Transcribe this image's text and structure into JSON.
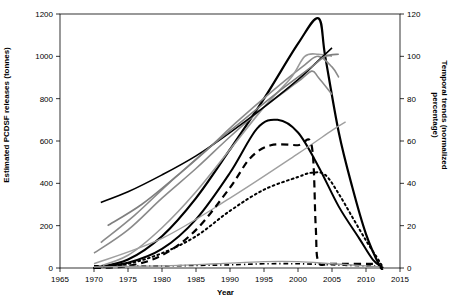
{
  "chart_data": {
    "type": "line",
    "title": "",
    "xlabel": "Year",
    "ylabel_left": "Estimated PCDSF releases (tonnes)",
    "ylabel_right": "Temporal trends (normalized percentage)",
    "xlim": [
      1965,
      2015
    ],
    "ylim_left": [
      0,
      1200
    ],
    "ylim_right": [
      0,
      120
    ],
    "xticks": [
      "1965",
      "1970",
      "1975",
      "1980",
      "1985",
      "1990",
      "1995",
      "2000",
      "2005",
      "2010",
      "2015"
    ],
    "yticks_left": [
      "0",
      "200",
      "400",
      "600",
      "800",
      "1000",
      "1200"
    ],
    "yticks_right": [
      "0",
      "20",
      "40",
      "60",
      "80",
      "100",
      "120"
    ],
    "grid": false,
    "legend": "none",
    "series": [
      {
        "name": "emission-curve-peak-2003-thick-black",
        "axis": "left",
        "color": "#000000",
        "width": 2.2,
        "dash": "none",
        "points": [
          [
            1970,
            0
          ],
          [
            1975,
            40
          ],
          [
            1980,
            150
          ],
          [
            1985,
            330
          ],
          [
            1990,
            560
          ],
          [
            1995,
            800
          ],
          [
            2000,
            1060
          ],
          [
            2003,
            1180
          ],
          [
            2004,
            1000
          ],
          [
            2006,
            640
          ],
          [
            2008,
            380
          ],
          [
            2010,
            160
          ],
          [
            2012,
            10
          ],
          [
            2012.5,
            0
          ]
        ]
      },
      {
        "name": "emission-curve-bell-peak-1997",
        "axis": "left",
        "color": "#000000",
        "width": 2.0,
        "dash": "none",
        "points": [
          [
            1970,
            5
          ],
          [
            1975,
            25
          ],
          [
            1980,
            90
          ],
          [
            1985,
            230
          ],
          [
            1990,
            450
          ],
          [
            1994,
            660
          ],
          [
            1997,
            700
          ],
          [
            2000,
            640
          ],
          [
            2003,
            480
          ],
          [
            2006,
            290
          ],
          [
            2009,
            140
          ],
          [
            2011,
            40
          ],
          [
            2012.5,
            0
          ]
        ]
      },
      {
        "name": "emission-curve-grey-rising-1",
        "axis": "left",
        "color": "#8a8a8a",
        "width": 1.6,
        "dash": "none",
        "points": [
          [
            1970,
            70
          ],
          [
            1975,
            180
          ],
          [
            1980,
            330
          ],
          [
            1985,
            470
          ],
          [
            1990,
            620
          ],
          [
            1995,
            760
          ],
          [
            2000,
            880
          ],
          [
            2002,
            930
          ],
          [
            2003,
            900
          ],
          [
            2005,
            820
          ]
        ]
      },
      {
        "name": "emission-curve-grey-rising-2",
        "axis": "left",
        "color": "#8a8a8a",
        "width": 1.6,
        "dash": "none",
        "points": [
          [
            1971,
            120
          ],
          [
            1976,
            250
          ],
          [
            1981,
            400
          ],
          [
            1986,
            540
          ],
          [
            1991,
            690
          ],
          [
            1996,
            830
          ],
          [
            2001,
            960
          ],
          [
            2003,
            1000
          ],
          [
            2005,
            950
          ],
          [
            2006,
            900
          ]
        ]
      },
      {
        "name": "emission-curve-grey-flat-top",
        "axis": "left",
        "color": "#9a9a9a",
        "width": 1.6,
        "dash": "none",
        "points": [
          [
            1970,
            0
          ],
          [
            1975,
            60
          ],
          [
            1980,
            190
          ],
          [
            1985,
            360
          ],
          [
            1990,
            560
          ],
          [
            1995,
            760
          ],
          [
            1999,
            900
          ],
          [
            2001,
            1000
          ],
          [
            2003,
            1010
          ],
          [
            2005,
            1000
          ]
        ]
      },
      {
        "name": "emission-curve-black-s-shape",
        "axis": "left",
        "color": "#000000",
        "width": 1.6,
        "dash": "none",
        "points": [
          [
            1971,
            310
          ],
          [
            1975,
            360
          ],
          [
            1980,
            440
          ],
          [
            1985,
            530
          ],
          [
            1990,
            640
          ],
          [
            1995,
            760
          ],
          [
            2000,
            890
          ],
          [
            2003,
            980
          ],
          [
            2005,
            1040
          ]
        ]
      },
      {
        "name": "emission-curve-grey-low-linear",
        "axis": "left",
        "color": "#a0a0a0",
        "width": 1.4,
        "dash": "none",
        "points": [
          [
            1970,
            20
          ],
          [
            1980,
            140
          ],
          [
            1990,
            330
          ],
          [
            2000,
            540
          ],
          [
            2005,
            650
          ],
          [
            2007,
            690
          ]
        ]
      },
      {
        "name": "emission-curve-grey-steep",
        "axis": "left",
        "color": "#7f7f7f",
        "width": 1.6,
        "dash": "none",
        "points": [
          [
            1972,
            200
          ],
          [
            1977,
            300
          ],
          [
            1982,
            430
          ],
          [
            1987,
            570
          ],
          [
            1992,
            700
          ],
          [
            1997,
            830
          ],
          [
            2002,
            950
          ],
          [
            2004,
            1000
          ],
          [
            2006,
            1010
          ]
        ]
      },
      {
        "name": "temporal-trend-dashed-plateau-58",
        "axis": "right",
        "color": "#000000",
        "width": 2.2,
        "dash": "dashed",
        "points": [
          [
            1970,
            0
          ],
          [
            1975,
            1
          ],
          [
            1980,
            6
          ],
          [
            1985,
            18
          ],
          [
            1990,
            38
          ],
          [
            1993,
            52
          ],
          [
            1996,
            58
          ],
          [
            2000,
            58
          ],
          [
            2002,
            58
          ],
          [
            2002.6,
            20
          ],
          [
            2003,
            3
          ],
          [
            2005,
            2
          ],
          [
            2012,
            2
          ]
        ]
      },
      {
        "name": "temporal-trend-dotted-peak-45",
        "axis": "right",
        "color": "#000000",
        "width": 2.0,
        "dash": "dotted",
        "points": [
          [
            1970,
            0
          ],
          [
            1975,
            2
          ],
          [
            1980,
            7
          ],
          [
            1985,
            15
          ],
          [
            1990,
            27
          ],
          [
            1995,
            37
          ],
          [
            2000,
            43
          ],
          [
            2002,
            45
          ],
          [
            2004,
            44
          ],
          [
            2006,
            35
          ],
          [
            2008,
            24
          ],
          [
            2010,
            13
          ],
          [
            2012,
            3
          ],
          [
            2012.5,
            0
          ]
        ]
      },
      {
        "name": "temporal-trend-baseline-dashdot",
        "axis": "right",
        "color": "#000000",
        "width": 1.6,
        "dash": "dashdot",
        "points": [
          [
            1970,
            1
          ],
          [
            1980,
            1
          ],
          [
            1990,
            1.5
          ],
          [
            1995,
            2
          ],
          [
            2000,
            2
          ],
          [
            2005,
            1.5
          ],
          [
            2010,
            1
          ],
          [
            2012,
            1
          ]
        ]
      },
      {
        "name": "temporal-trend-grey-low-bump",
        "axis": "right",
        "color": "#9a9a9a",
        "width": 1.4,
        "dash": "none",
        "points": [
          [
            1970,
            0.5
          ],
          [
            1980,
            1
          ],
          [
            1988,
            2
          ],
          [
            1995,
            3
          ],
          [
            2000,
            3
          ],
          [
            2005,
            2
          ],
          [
            2010,
            1
          ],
          [
            2012,
            0.5
          ]
        ]
      }
    ]
  }
}
